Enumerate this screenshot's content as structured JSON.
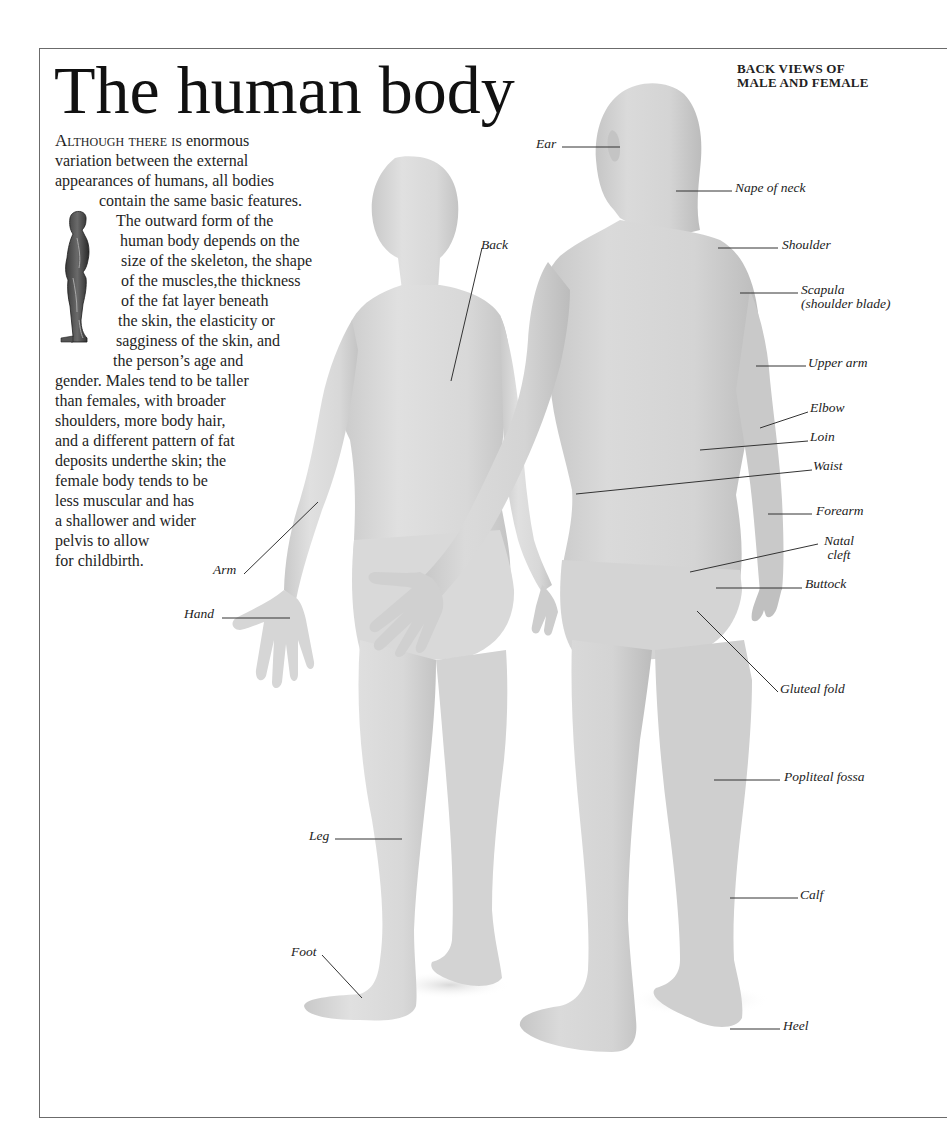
{
  "page": {
    "title": "The human body",
    "subtitle_lines": [
      "BACK VIEWS OF",
      "MALE AND FEMALE"
    ]
  },
  "intro": {
    "lead_small_caps": "Although there is",
    "lines": [
      " enormous",
      "variation between the external",
      "appearances of humans, all bodies",
      "contain the same basic features.",
      "The outward form of the",
      "human body depends on the",
      "size of the skeleton, the shape",
      "of the muscles,the thickness",
      "of the fat layer beneath",
      "the skin, the elasticity or",
      "sagginess of the skin, and",
      "the person’s age and",
      "gender. Males tend to be taller",
      "than females, with broader",
      "shoulders, more body hair,",
      "and a different pattern of fat",
      "deposits underthe skin; the",
      "female body tends to be",
      "less muscular and has",
      "a shallower and wider",
      "pelvis to allow",
      "for childbirth."
    ]
  },
  "thumbnail": {
    "icon": "anatomical-figure-thumbnail-icon",
    "description": "Small side-view muscle figure illustration"
  },
  "figures": {
    "female": {
      "view": "back",
      "tone": "#d9d9d9"
    },
    "male": {
      "view": "back",
      "tone": "#d2d2d2"
    }
  },
  "labels": {
    "female": [
      {
        "id": "back",
        "text": "Back"
      },
      {
        "id": "arm",
        "text": "Arm"
      },
      {
        "id": "hand",
        "text": "Hand"
      },
      {
        "id": "leg",
        "text": "Leg"
      },
      {
        "id": "foot",
        "text": "Foot"
      }
    ],
    "male": [
      {
        "id": "ear",
        "text": "Ear"
      },
      {
        "id": "nape-of-neck",
        "text": "Nape of neck"
      },
      {
        "id": "shoulder",
        "text": "Shoulder"
      },
      {
        "id": "scapula",
        "text": "Scapula",
        "text2": "(shoulder blade)"
      },
      {
        "id": "upper-arm",
        "text": "Upper arm"
      },
      {
        "id": "elbow",
        "text": "Elbow"
      },
      {
        "id": "loin",
        "text": "Loin"
      },
      {
        "id": "waist",
        "text": "Waist"
      },
      {
        "id": "forearm",
        "text": "Forearm"
      },
      {
        "id": "natal-cleft",
        "text": "Natal",
        "text2": "cleft"
      },
      {
        "id": "buttock",
        "text": "Buttock"
      },
      {
        "id": "gluteal-fold",
        "text": "Gluteal fold"
      },
      {
        "id": "popliteal-fossa",
        "text": "Popliteal fossa"
      },
      {
        "id": "calf",
        "text": "Calf"
      },
      {
        "id": "heel",
        "text": "Heel"
      }
    ]
  },
  "colors": {
    "frame": "#6b6b6b",
    "text": "#1a1a1a",
    "leader_line": "#333333",
    "skin_light": "#dedede",
    "skin_mid": "#cfcfcf",
    "skin_shadow": "#bdbdbd"
  }
}
